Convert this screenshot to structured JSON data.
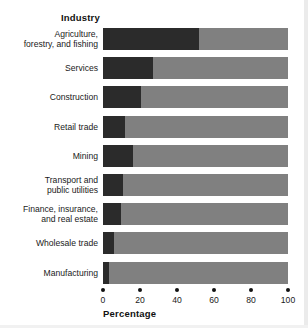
{
  "chart_data": {
    "type": "bar",
    "orientation": "horizontal",
    "stacked": true,
    "title": "",
    "ylabel": "Industry",
    "xlabel": "Percentage",
    "xlim": [
      0,
      100
    ],
    "xticks": [
      0,
      20,
      40,
      60,
      80,
      100
    ],
    "xtick_labels": [
      "0",
      "20",
      "40",
      "60",
      "80",
      "100"
    ],
    "grid": false,
    "legend": null,
    "colors": {
      "segment_primary": "#2b2b2b",
      "segment_remainder": "#808080",
      "text": "#1a1a1a",
      "background": "#ffffff"
    },
    "categories": [
      "Agriculture, forestry, and fishing",
      "Services",
      "Construction",
      "Retail trade",
      "Mining",
      "Transport and public utilities",
      "Finance, insurance, and real estate",
      "Wholesale trade",
      "Manufacturing"
    ],
    "series": [
      {
        "name": "segment_primary",
        "values": [
          52,
          27,
          20.5,
          12,
          16,
          11,
          9.5,
          6,
          3.5
        ]
      },
      {
        "name": "segment_remainder",
        "values": [
          48,
          73,
          79.5,
          88,
          84,
          89,
          90.5,
          94,
          96.5
        ]
      }
    ]
  },
  "rows": [
    {
      "lines": [
        "Agriculture,",
        "forestry, and fishing"
      ],
      "value": 52
    },
    {
      "lines": [
        "Services"
      ],
      "value": 27
    },
    {
      "lines": [
        "Construction"
      ],
      "value": 20.5
    },
    {
      "lines": [
        "Retail trade"
      ],
      "value": 12
    },
    {
      "lines": [
        "Mining"
      ],
      "value": 16
    },
    {
      "lines": [
        "Transport and",
        "public utilities"
      ],
      "value": 11
    },
    {
      "lines": [
        "Finance, insurance,",
        "and real estate"
      ],
      "value": 9.5
    },
    {
      "lines": [
        "Wholesale trade"
      ],
      "value": 6
    },
    {
      "lines": [
        "Manufacturing"
      ],
      "value": 3.5
    }
  ]
}
